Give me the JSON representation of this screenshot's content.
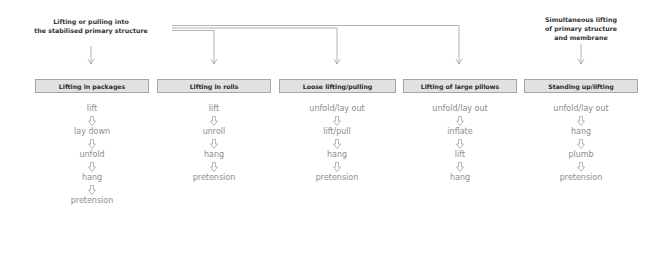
{
  "notes": {
    "left": [
      "Lifting or pulling into",
      "the stabilised primary structure"
    ],
    "right": [
      "Simultaneous lifting",
      "of primary structure",
      "and membrane"
    ]
  },
  "columns": [
    {
      "title": "Lifting in packages",
      "steps": [
        "lift",
        "lay down",
        "unfold",
        "hang",
        "pretension"
      ]
    },
    {
      "title": "Lifting in rolls",
      "steps": [
        "lift",
        "unroll",
        "hang",
        "pretension"
      ]
    },
    {
      "title": "Loose lifting/pulling",
      "steps": [
        "unfold/lay out",
        "lift/pull",
        "hang",
        "pretension"
      ]
    },
    {
      "title": "Lifting of large pillows",
      "steps": [
        "unfold/lay out",
        "inflate",
        "lift",
        "hang"
      ]
    },
    {
      "title": "Standing up/lifting",
      "steps": [
        "unfold/lay out",
        "hang",
        "plumb",
        "pretension"
      ]
    }
  ],
  "icons": {
    "step_arrow": "hollow-down-arrow-icon",
    "connector_arrow": "thin-down-arrow-icon"
  },
  "colors": {
    "box_fill": "#e1e1e1",
    "box_border": "#a6a6a6",
    "step_text": "#8c8c8c",
    "line": "#a0a0a0"
  }
}
